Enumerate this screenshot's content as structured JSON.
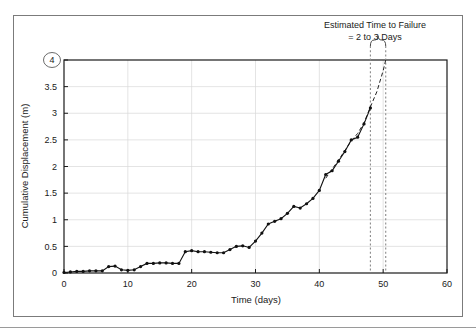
{
  "figure": {
    "background_color": "#ffffff",
    "frame_color": "#7b7b7b",
    "axis_color": "#1a1a1a",
    "grid_color": "#d9d9d9",
    "series_color": "#111111",
    "projection_color": "#222222"
  },
  "annotation": {
    "line1": "Estimated Time to Failure",
    "line2": "= 2 to 3 Days",
    "brace_name": "curly-brace"
  },
  "highlight": {
    "circled_axis_value": "4"
  },
  "chart_data": {
    "type": "line",
    "title": "",
    "subtitle": "",
    "xlabel": "Time (days)",
    "ylabel": "Cumulative Displacement (m)",
    "xlim": [
      0,
      60
    ],
    "ylim": [
      0,
      4
    ],
    "xticks": [
      0,
      10,
      20,
      30,
      40,
      50,
      60
    ],
    "xtick_labels": [
      "0",
      "10",
      "20",
      "30",
      "40",
      "50",
      "60"
    ],
    "yticks": [
      0,
      0.5,
      1,
      1.5,
      2,
      2.5,
      3,
      3.5,
      4
    ],
    "ytick_labels": [
      "0",
      "0.5",
      "1",
      "1.5",
      "2",
      "2.5",
      "3",
      "3.5",
      "4"
    ],
    "grid": true,
    "grid_axes": "both",
    "legend": false,
    "legend_position": "none",
    "series": [
      {
        "name": "Measured cumulative displacement",
        "style": "solid-with-markers",
        "marker": "filled-circle",
        "x": [
          0,
          1,
          2,
          3,
          4,
          5,
          6,
          7,
          8,
          9,
          10,
          11,
          12,
          13,
          14,
          15,
          16,
          17,
          18,
          19,
          20,
          21,
          22,
          23,
          24,
          25,
          26,
          27,
          28,
          29,
          30,
          31,
          32,
          33,
          34,
          35,
          36,
          37,
          38,
          39,
          40,
          41,
          42,
          43,
          44,
          45,
          46,
          47,
          48
        ],
        "y": [
          0.01,
          0.02,
          0.03,
          0.03,
          0.04,
          0.04,
          0.04,
          0.12,
          0.13,
          0.06,
          0.05,
          0.06,
          0.12,
          0.18,
          0.18,
          0.19,
          0.19,
          0.18,
          0.18,
          0.4,
          0.42,
          0.4,
          0.4,
          0.39,
          0.38,
          0.38,
          0.44,
          0.5,
          0.51,
          0.48,
          0.6,
          0.75,
          0.92,
          0.97,
          1.02,
          1.12,
          1.25,
          1.22,
          1.3,
          1.4,
          1.55,
          1.85,
          1.92,
          2.1,
          2.28,
          2.5,
          2.55,
          2.8,
          3.1
        ]
      },
      {
        "name": "Projected failure trend",
        "style": "dashed",
        "marker": "none",
        "x": [
          41,
          42,
          43,
          44,
          45,
          46,
          47,
          48,
          49,
          50,
          50.4
        ],
        "y": [
          1.78,
          1.95,
          2.12,
          2.3,
          2.48,
          2.62,
          2.82,
          3.12,
          3.4,
          3.8,
          4.0
        ]
      }
    ],
    "vertical_markers": [
      {
        "name": "last-measurement-line",
        "x": 48,
        "style": "dashed"
      },
      {
        "name": "projected-failure-line",
        "x": 50.4,
        "style": "dashed"
      }
    ]
  }
}
